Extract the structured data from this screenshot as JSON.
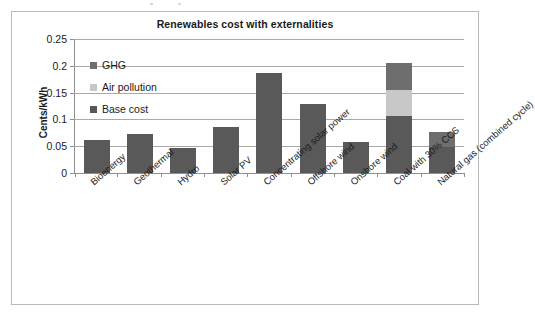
{
  "chart_data": {
    "type": "bar",
    "subtype": "stacked-bar",
    "title": "Renewables cost with externalities",
    "xlabel": "",
    "ylabel": "Cents/kWh",
    "ylim": [
      0,
      0.25
    ],
    "ytick_labels": [
      "0.25",
      "0.2",
      "0.15",
      "0.1",
      "0.05",
      "0"
    ],
    "ytick_values": [
      0.25,
      0.2,
      0.15,
      0.1,
      0.05,
      0
    ],
    "grid": "horizontal",
    "legend_position": "inside-top-left",
    "categories": [
      "Bioenergy",
      "Geothermal",
      "Hydro",
      "Solar PV",
      "Concentrating solar power",
      "Offshore wind",
      "Onshore wind",
      "Coal with 30% CCS",
      "Natural gas (combined cycle)"
    ],
    "series": [
      {
        "name": "Base cost",
        "color": "#595959",
        "values": [
          0.062,
          0.073,
          0.047,
          0.086,
          0.187,
          0.128,
          0.057,
          0.107,
          0.048
        ]
      },
      {
        "name": "Air pollution",
        "color": "#c8c8c8",
        "values": [
          0,
          0,
          0,
          0,
          0,
          0,
          0,
          0.048,
          0
        ]
      },
      {
        "name": "GHG",
        "color": "#6e6e6e",
        "values": [
          0,
          0,
          0,
          0,
          0,
          0,
          0,
          0.05,
          0.028
        ]
      }
    ],
    "totals": [
      0.062,
      0.073,
      0.047,
      0.086,
      0.187,
      0.128,
      0.057,
      0.205,
      0.076
    ]
  },
  "legend": {
    "items": [
      {
        "label": "GHG",
        "color": "#6e6e6e"
      },
      {
        "label": "Air pollution",
        "color": "#c8c8c8"
      },
      {
        "label": "Base cost",
        "color": "#595959"
      }
    ]
  },
  "colors": {
    "base_cost": "#595959",
    "air_pollution": "#c8c8c8",
    "ghg": "#6e6e6e",
    "gridline": "#a9a9a9",
    "axis": "#8f8f8f",
    "frame": "#b9b9b9",
    "text": "#1a1a1a"
  }
}
